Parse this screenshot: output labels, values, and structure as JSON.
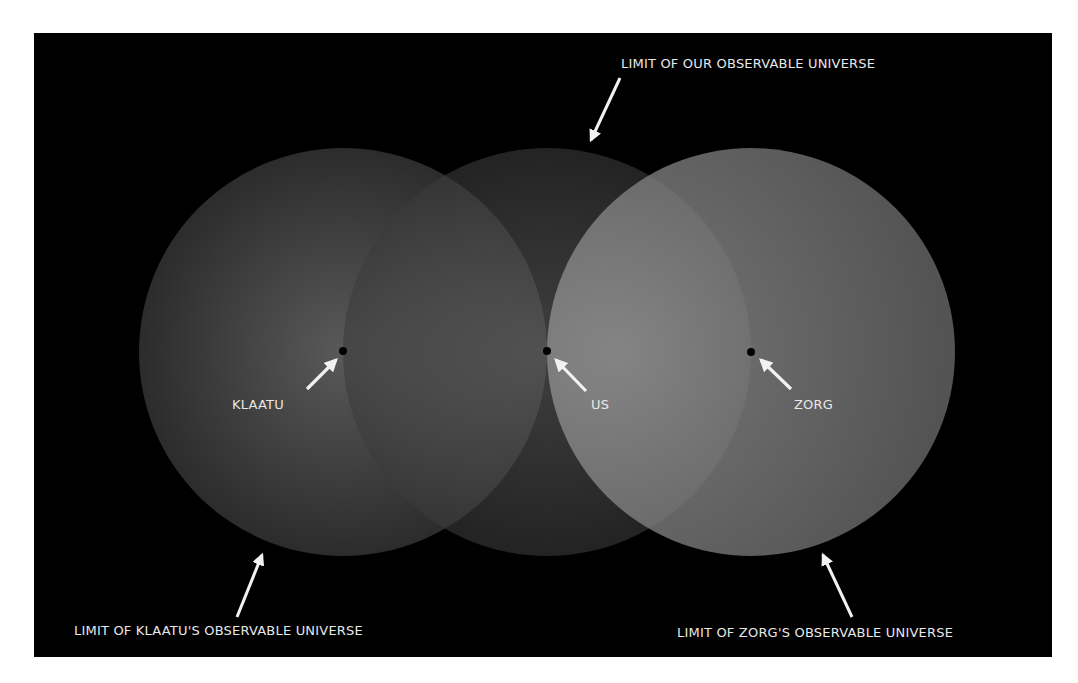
{
  "diagram": {
    "background_color": "#000000",
    "observers": [
      {
        "name": "KLAATU",
        "label": "KLAATU",
        "limit_label": "LIMIT OF KLAATU'S OBSERVABLE UNIVERSE"
      },
      {
        "name": "US",
        "label": "US",
        "limit_label": "LIMIT OF OUR OBSERVABLE UNIVERSE"
      },
      {
        "name": "ZORG",
        "label": "ZORG",
        "limit_label": "LIMIT OF ZORG'S OBSERVABLE UNIVERSE"
      }
    ],
    "colors": {
      "circle_fill": "#8a8a8a",
      "label": "#e8e8e8",
      "arrow": "#f2f2f2",
      "point": "#000000"
    }
  }
}
